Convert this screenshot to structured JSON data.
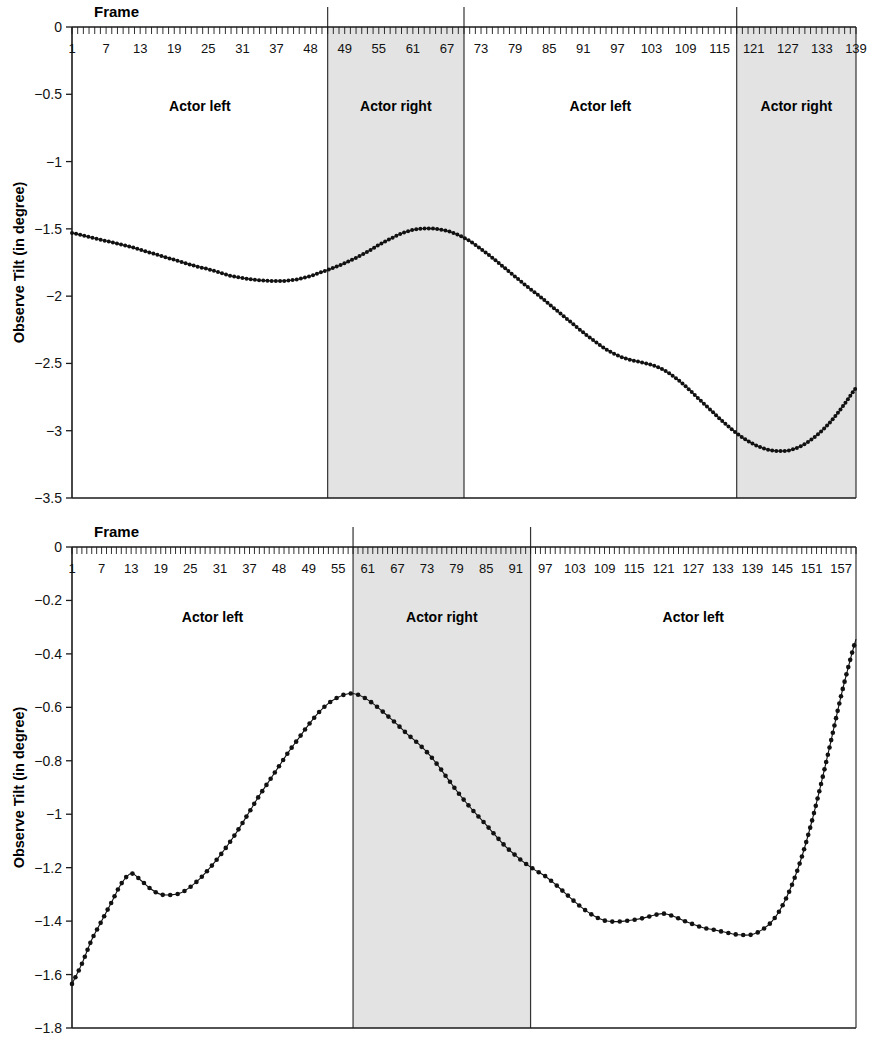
{
  "figure": {
    "background": "#ffffff",
    "shade_color": "#e3e3e3",
    "line_color": "#111111"
  },
  "charts": [
    {
      "id": "top",
      "chart_data": {
        "type": "line",
        "title": "",
        "xlabel": "Frame",
        "ylabel": "Observe Tilt (in degree)",
        "xlim": [
          1,
          139
        ],
        "ylim": [
          -3.5,
          0
        ],
        "grid": false,
        "legend": "none",
        "ytick_labels": [
          "0",
          "−0.5",
          "−1",
          "−1.5",
          "−2",
          "−2.5",
          "−3",
          "−3.5"
        ],
        "ytick_values": [
          0,
          -0.5,
          -1,
          -1.5,
          -2,
          -2.5,
          -3,
          -3.5
        ],
        "xtick_labels": [
          "1",
          "7",
          "13",
          "19",
          "25",
          "31",
          "37",
          "48",
          "49",
          "55",
          "61",
          "67",
          "73",
          "79",
          "85",
          "91",
          "97",
          "103",
          "109",
          "115",
          "121",
          "127",
          "133",
          "139"
        ],
        "xtick_values": [
          1,
          7,
          13,
          19,
          25,
          31,
          37,
          43,
          49,
          55,
          61,
          67,
          73,
          79,
          85,
          91,
          97,
          103,
          109,
          115,
          121,
          127,
          133,
          139
        ],
        "regions": [
          {
            "label": "Actor left",
            "start": 1,
            "end": 46,
            "shaded": false
          },
          {
            "label": "Actor right",
            "start": 46,
            "end": 70,
            "shaded": true
          },
          {
            "label": "Actor left",
            "start": 70,
            "end": 118,
            "shaded": false
          },
          {
            "label": "Actor right",
            "start": 118,
            "end": 139,
            "shaded": true
          }
        ],
        "x": [
          1,
          3,
          5,
          7,
          9,
          11,
          13,
          15,
          17,
          19,
          21,
          23,
          25,
          27,
          29,
          31,
          33,
          35,
          37,
          39,
          41,
          43,
          45,
          47,
          49,
          51,
          53,
          55,
          57,
          59,
          61,
          63,
          65,
          67,
          69,
          71,
          73,
          75,
          77,
          79,
          81,
          83,
          85,
          87,
          89,
          91,
          93,
          95,
          97,
          99,
          101,
          103,
          105,
          107,
          109,
          111,
          113,
          115,
          117,
          119,
          121,
          123,
          125,
          127,
          129,
          131,
          133,
          135,
          137,
          139
        ],
        "values": [
          -1.53,
          -1.55,
          -1.57,
          -1.59,
          -1.61,
          -1.63,
          -1.655,
          -1.68,
          -1.705,
          -1.73,
          -1.755,
          -1.78,
          -1.8,
          -1.825,
          -1.85,
          -1.865,
          -1.878,
          -1.885,
          -1.888,
          -1.885,
          -1.872,
          -1.85,
          -1.82,
          -1.79,
          -1.755,
          -1.715,
          -1.67,
          -1.62,
          -1.575,
          -1.535,
          -1.508,
          -1.497,
          -1.5,
          -1.515,
          -1.545,
          -1.59,
          -1.65,
          -1.715,
          -1.785,
          -1.855,
          -1.925,
          -1.99,
          -2.06,
          -2.13,
          -2.2,
          -2.27,
          -2.335,
          -2.395,
          -2.44,
          -2.47,
          -2.49,
          -2.51,
          -2.545,
          -2.6,
          -2.67,
          -2.75,
          -2.83,
          -2.91,
          -2.985,
          -3.05,
          -3.1,
          -3.135,
          -3.15,
          -3.148,
          -3.12,
          -3.07,
          -3.0,
          -2.91,
          -2.8,
          -2.68
        ],
        "marker": {
          "shape": "circle",
          "size": 2.0
        }
      }
    },
    {
      "id": "bottom",
      "chart_data": {
        "type": "line",
        "title": "",
        "xlabel": "Frame",
        "ylabel": "Observe Tilt (in degree)",
        "xlim": [
          1,
          160
        ],
        "ylim": [
          -1.8,
          0
        ],
        "grid": false,
        "legend": "none",
        "ytick_labels": [
          "0",
          "−0.2",
          "−0.4",
          "−0.6",
          "−0.8",
          "−1",
          "−1.2",
          "−1.4",
          "−1.6",
          "−1.8"
        ],
        "ytick_values": [
          0,
          -0.2,
          -0.4,
          -0.6,
          -0.8,
          -1,
          -1.2,
          -1.4,
          -1.6,
          -1.8
        ],
        "xtick_labels": [
          "1",
          "7",
          "13",
          "19",
          "25",
          "31",
          "37",
          "48",
          "49",
          "55",
          "61",
          "67",
          "73",
          "79",
          "85",
          "91",
          "97",
          "103",
          "109",
          "115",
          "121",
          "127",
          "133",
          "139",
          "145",
          "151",
          "157"
        ],
        "xtick_values": [
          1,
          7,
          13,
          19,
          25,
          31,
          37,
          43,
          49,
          55,
          61,
          67,
          73,
          79,
          85,
          91,
          97,
          103,
          109,
          115,
          121,
          127,
          133,
          139,
          145,
          151,
          157
        ],
        "regions": [
          {
            "label": "Actor left",
            "start": 1,
            "end": 58,
            "shaded": false
          },
          {
            "label": "Actor right",
            "start": 58,
            "end": 94,
            "shaded": true
          },
          {
            "label": "Actor left",
            "start": 94,
            "end": 160,
            "shaded": false
          }
        ],
        "x": [
          1,
          3,
          5,
          7,
          9,
          11,
          13,
          15,
          17,
          19,
          21,
          23,
          25,
          27,
          29,
          31,
          33,
          35,
          37,
          39,
          41,
          43,
          45,
          47,
          49,
          51,
          53,
          55,
          57,
          59,
          61,
          63,
          65,
          67,
          69,
          71,
          73,
          75,
          77,
          79,
          81,
          83,
          85,
          87,
          89,
          91,
          93,
          95,
          97,
          99,
          101,
          103,
          105,
          107,
          109,
          111,
          113,
          115,
          117,
          119,
          121,
          123,
          125,
          127,
          129,
          131,
          133,
          135,
          137,
          139,
          141,
          143,
          145,
          147,
          149,
          151,
          153,
          155,
          157,
          159
        ],
        "values": [
          -1.635,
          -1.56,
          -1.47,
          -1.4,
          -1.33,
          -1.26,
          -1.222,
          -1.248,
          -1.28,
          -1.3,
          -1.302,
          -1.295,
          -1.272,
          -1.24,
          -1.2,
          -1.155,
          -1.105,
          -1.05,
          -0.99,
          -0.93,
          -0.875,
          -0.82,
          -0.765,
          -0.715,
          -0.665,
          -0.62,
          -0.585,
          -0.562,
          -0.549,
          -0.553,
          -0.572,
          -0.6,
          -0.632,
          -0.665,
          -0.7,
          -0.732,
          -0.768,
          -0.812,
          -0.862,
          -0.912,
          -0.958,
          -1.0,
          -1.04,
          -1.082,
          -1.122,
          -1.155,
          -1.185,
          -1.21,
          -1.232,
          -1.262,
          -1.295,
          -1.328,
          -1.358,
          -1.382,
          -1.398,
          -1.402,
          -1.4,
          -1.395,
          -1.388,
          -1.378,
          -1.372,
          -1.382,
          -1.398,
          -1.412,
          -1.425,
          -1.432,
          -1.44,
          -1.448,
          -1.452,
          -1.45,
          -1.432,
          -1.4,
          -1.345,
          -1.265,
          -1.16,
          -1.03,
          -0.88,
          -0.72,
          -0.555,
          -0.41
        ],
        "extra_tail": {
          "x": [
            160,
            162,
            164,
            166,
            168
          ],
          "values": [
            -0.345,
            -0.305,
            -0.295,
            -0.305,
            -0.325
          ]
        },
        "marker": {
          "shape": "circle",
          "size": 2.3
        }
      }
    }
  ]
}
